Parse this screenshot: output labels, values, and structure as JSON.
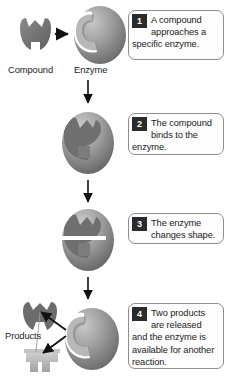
{
  "diagram": {
    "colors": {
      "shape_dark": "#6d6d6d",
      "shape_mid": "#8f8f8f",
      "shape_light": "#b9b9b9",
      "badge_bg": "#2b2b2b",
      "callout_border": "#8d8d8d",
      "arrow": "#111111",
      "background": "#ffffff"
    },
    "labels": [
      {
        "id": "compound",
        "text": "Compound"
      },
      {
        "id": "enzyme",
        "text": "Enzyme"
      },
      {
        "id": "products",
        "text": "Products"
      }
    ],
    "steps": [
      {
        "number": "1",
        "text": "A compound approaches a specific enzyme."
      },
      {
        "number": "2",
        "text": "The compound binds to the enzyme."
      },
      {
        "number": "3",
        "text": "The enzyme changes shape."
      },
      {
        "number": "4",
        "text": "Two products are released and the enzyme is available for another reaction."
      }
    ]
  }
}
